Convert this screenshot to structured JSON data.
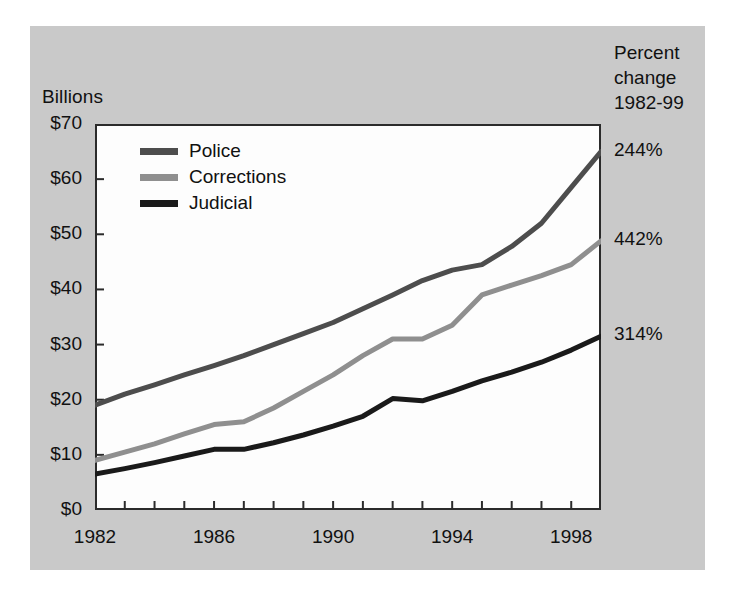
{
  "figure": {
    "y_axis_title": "Billions",
    "corner_note_lines": [
      "Percent",
      "change",
      "1982-99"
    ],
    "background_color": "#c9c9c9",
    "plot_background_color": "#fdfdfd",
    "frame_color": "#2b2b2b"
  },
  "legend": {
    "position": "inside-top-left",
    "items": [
      {
        "label": "Police",
        "color": "#4d4d4d"
      },
      {
        "label": "Corrections",
        "color": "#8f8f8f"
      },
      {
        "label": "Judicial",
        "color": "#1a1a1a"
      }
    ]
  },
  "percent_change_labels": [
    {
      "series": "Police",
      "value": "244%"
    },
    {
      "series": "Corrections",
      "value": "442%"
    },
    {
      "series": "Judicial",
      "value": "314%"
    }
  ],
  "chart_data": {
    "type": "line",
    "title": "",
    "subtitle": "",
    "xlabel": "",
    "ylabel": "Billions",
    "xlim": [
      1982,
      1999
    ],
    "ylim": [
      0,
      70
    ],
    "grid": false,
    "legend_position": "inside-top-left",
    "y_ticks": [
      0,
      10,
      20,
      30,
      40,
      50,
      60,
      70
    ],
    "y_tick_labels": [
      "$0",
      "$10",
      "$20",
      "$30",
      "$40",
      "$50",
      "$60",
      "$70"
    ],
    "x_ticks": [
      1982,
      1983,
      1984,
      1985,
      1986,
      1987,
      1988,
      1989,
      1990,
      1991,
      1992,
      1993,
      1994,
      1995,
      1996,
      1997,
      1998,
      1999
    ],
    "x_tick_labels_shown": [
      "1982",
      "1986",
      "1990",
      "1994",
      "1998"
    ],
    "x": [
      1982,
      1983,
      1984,
      1985,
      1986,
      1987,
      1988,
      1989,
      1990,
      1991,
      1992,
      1993,
      1994,
      1995,
      1996,
      1997,
      1998,
      1999
    ],
    "series": [
      {
        "name": "Police",
        "color": "#4d4d4d",
        "percent_change_1982_99": "244%",
        "values": [
          19.0,
          21.0,
          22.7,
          24.5,
          26.2,
          28.0,
          30.0,
          32.0,
          34.0,
          36.5,
          39.0,
          41.6,
          43.5,
          44.5,
          47.8,
          52.0,
          58.5,
          65.0
        ]
      },
      {
        "name": "Corrections",
        "color": "#8f8f8f",
        "percent_change_1982_99": "442%",
        "values": [
          9.0,
          10.5,
          12.0,
          13.8,
          15.5,
          16.0,
          18.5,
          21.5,
          24.5,
          28.0,
          31.0,
          31.0,
          33.5,
          39.0,
          40.8,
          42.5,
          44.5,
          48.8
        ]
      },
      {
        "name": "Judicial",
        "color": "#1a1a1a",
        "percent_change_1982_99": "314%",
        "values": [
          6.5,
          7.5,
          8.6,
          9.8,
          11.0,
          11.0,
          12.2,
          13.6,
          15.2,
          17.0,
          20.2,
          19.8,
          21.5,
          23.4,
          25.0,
          26.8,
          29.0,
          31.5
        ]
      }
    ]
  }
}
